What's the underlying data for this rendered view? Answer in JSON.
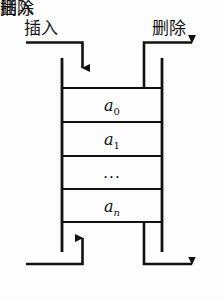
{
  "figure": {
    "line_color": "#111111",
    "background": "#fdfdfd",
    "text_color": "#151515"
  },
  "labels": {
    "insert_top": "插入",
    "delete_top": "删除",
    "insert_bottom": "插入",
    "delete_bottom": "删除"
  },
  "cells": [
    {
      "base": "a",
      "sub": "0",
      "italic_sub": false
    },
    {
      "base": "a",
      "sub": "1",
      "italic_sub": false
    },
    {
      "base": "...",
      "sub": "",
      "italic_sub": false
    },
    {
      "base": "a",
      "sub": "n",
      "italic_sub": true
    }
  ],
  "cell_values": {
    "row0": "a",
    "row0_sub": "0",
    "row1": "a",
    "row1_sub": "1",
    "row2": "...",
    "row3": "a",
    "row3_sub": "n"
  },
  "arrows": {
    "top_left": {
      "name": "insert-front-arrow",
      "direction": "down-into-structure"
    },
    "top_right": {
      "name": "delete-front-arrow",
      "direction": "right-out-of-structure"
    },
    "bottom_left": {
      "name": "insert-rear-arrow",
      "direction": "up-into-structure"
    },
    "bottom_right": {
      "name": "delete-rear-arrow",
      "direction": "right-out-of-structure"
    }
  }
}
